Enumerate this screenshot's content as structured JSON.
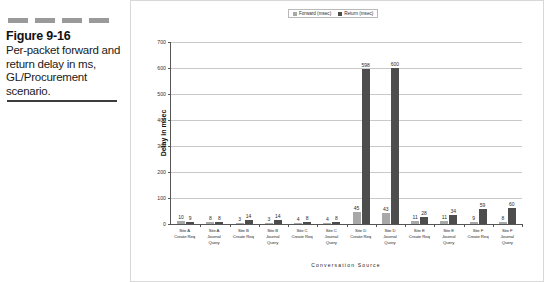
{
  "caption": {
    "figure_number": "Figure 9-16",
    "text": "Per-packet forward and return delay in ms, GL/Procurement scenario."
  },
  "legend": {
    "items": [
      {
        "label": "Forward (msec)",
        "color": "#a8a8a8"
      },
      {
        "label": "Return (msec)",
        "color": "#4d4d4d"
      }
    ]
  },
  "chart_data": {
    "type": "bar",
    "title": "",
    "xlabel": "Conversation Source",
    "ylabel": "Delay in msec",
    "ylim": [
      0,
      700
    ],
    "yticks": [
      0,
      100,
      200,
      300,
      400,
      500,
      600,
      700
    ],
    "grid": true,
    "legend_position": "top",
    "categories": [
      "Site A\nCreate Req",
      "Site A\nJournal\nQuery",
      "Site B\nCreate Req",
      "Site B\nJournal\nQuery",
      "Site C\nCreate Req",
      "Site C\nJournal\nQuery",
      "Site D\nCreate Req",
      "Site D\nJournal\nQuery",
      "Site E\nCreate Req",
      "Site E\nJournal\nQuery",
      "Site F\nCreate Req",
      "Site F\nJournal\nQuery"
    ],
    "series": [
      {
        "name": "Forward (msec)",
        "color": "#a8a8a8",
        "values": [
          10,
          8,
          3,
          3,
          4,
          4,
          45,
          43,
          11,
          11,
          9,
          8
        ]
      },
      {
        "name": "Return (msec)",
        "color": "#4d4d4d",
        "values": [
          9,
          8,
          14,
          14,
          8,
          8,
          598,
          600,
          28,
          34,
          59,
          60
        ]
      }
    ]
  }
}
